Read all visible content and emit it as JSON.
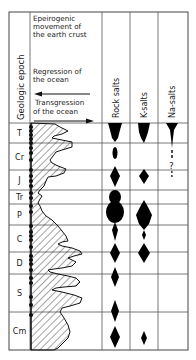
{
  "header": {
    "epoch_label": "Geologic epoch",
    "movement_title": [
      "Epeirogenic",
      "movement of",
      "the earth crust"
    ],
    "regression_label": [
      "Regression of",
      "the ocean"
    ],
    "transgression_label": [
      "Transgression",
      "of the ocean"
    ],
    "columns": [
      "Rock salts",
      "K-salts",
      "Na-salts"
    ]
  },
  "layout": {
    "box": {
      "x": 9,
      "y": 12,
      "w": 179,
      "h": 338
    },
    "col_x": [
      30,
      102,
      130,
      158
    ],
    "header_bottom": 123
  },
  "epochs": [
    {
      "label": "T",
      "y0": 123,
      "y1": 143
    },
    {
      "label": "Cr",
      "y0": 143,
      "y1": 170
    },
    {
      "label": "J",
      "y0": 170,
      "y1": 190
    },
    {
      "label": "Tr",
      "y0": 190,
      "y1": 204
    },
    {
      "label": "P",
      "y0": 204,
      "y1": 225
    },
    {
      "label": "C",
      "y0": 225,
      "y1": 252
    },
    {
      "label": "D",
      "y0": 252,
      "y1": 274
    },
    {
      "label": "S",
      "y0": 274,
      "y1": 312
    },
    {
      "label": "Cm",
      "y0": 312,
      "y1": 350
    }
  ],
  "dots_y": [
    127,
    131,
    135,
    139,
    143,
    148,
    153,
    160,
    170,
    176,
    181,
    186,
    193,
    198,
    206,
    212,
    226,
    232,
    236,
    240,
    247,
    256,
    260,
    264,
    270,
    278,
    283,
    297,
    305,
    315
  ],
  "symbols": {
    "question_mark": "?",
    "na_question": {
      "x": 172,
      "y": 167
    }
  },
  "colors": {
    "ink": "#111111",
    "line": "#555555",
    "bg": "#ffffff"
  }
}
